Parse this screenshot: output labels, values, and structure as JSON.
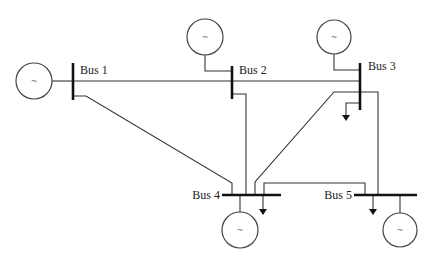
{
  "diagram": {
    "type": "five-bus power system one-line diagram",
    "colors": {
      "line": "#333333",
      "bus": "#111111",
      "background": "#ffffff"
    },
    "buses": [
      {
        "id": 1,
        "label": "Bus 1",
        "has_generator": true,
        "has_load": false
      },
      {
        "id": 2,
        "label": "Bus 2",
        "has_generator": true,
        "has_load": false
      },
      {
        "id": 3,
        "label": "Bus 3",
        "has_generator": true,
        "has_load": true
      },
      {
        "id": 4,
        "label": "Bus 4",
        "has_generator": true,
        "has_load": true
      },
      {
        "id": 5,
        "label": "Bus 5",
        "has_generator": true,
        "has_load": true
      }
    ],
    "generator_symbol": "~",
    "lines": [
      {
        "from": "Bus 1",
        "to": "Bus 2"
      },
      {
        "from": "Bus 1",
        "to": "Bus 4"
      },
      {
        "from": "Bus 2",
        "to": "Bus 3"
      },
      {
        "from": "Bus 2",
        "to": "Bus 4"
      },
      {
        "from": "Bus 3",
        "to": "Bus 4"
      },
      {
        "from": "Bus 3",
        "to": "Bus 5"
      },
      {
        "from": "Bus 4",
        "to": "Bus 5"
      }
    ]
  }
}
